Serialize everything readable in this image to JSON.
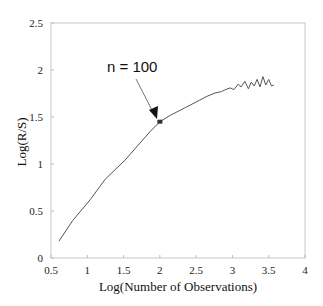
{
  "chart_data": {
    "type": "line",
    "title": "",
    "xlabel": "Log(Number of Observations)",
    "ylabel": "Log(R/S)",
    "xlim": [
      0.5,
      4
    ],
    "ylim": [
      0,
      2.5
    ],
    "xticks": [
      0.5,
      1,
      1.5,
      2,
      2.5,
      3,
      3.5,
      4
    ],
    "xtick_labels": [
      "0.5",
      "1",
      "1.5",
      "2",
      "2.5",
      "3",
      "3.5",
      "4"
    ],
    "yticks": [
      0,
      0.5,
      1,
      1.5,
      2,
      2.5
    ],
    "ytick_labels": [
      "0",
      "0.5",
      "1",
      "1.5",
      "2",
      "2.5"
    ],
    "grid": false,
    "legend": null,
    "series": [
      {
        "name": "R/S",
        "color": "#555555",
        "x": [
          0.61,
          0.8,
          1.04,
          1.25,
          1.52,
          1.7,
          1.86,
          2.0,
          2.15,
          2.35,
          2.55,
          2.65,
          2.76,
          2.85,
          2.9,
          2.97,
          3.02,
          3.08,
          3.12,
          3.17,
          3.22,
          3.26,
          3.3,
          3.34,
          3.38,
          3.42,
          3.46,
          3.5,
          3.54,
          3.57
        ],
        "y": [
          0.18,
          0.4,
          0.62,
          0.84,
          1.04,
          1.2,
          1.34,
          1.45,
          1.52,
          1.6,
          1.68,
          1.72,
          1.755,
          1.77,
          1.79,
          1.81,
          1.79,
          1.85,
          1.82,
          1.88,
          1.8,
          1.87,
          1.83,
          1.9,
          1.82,
          1.93,
          1.84,
          1.9,
          1.83,
          1.84
        ]
      }
    ],
    "annotations": [
      {
        "text": "n = 100",
        "point": {
          "x": 2.0,
          "y": 1.45
        },
        "arrow": true,
        "marker": true
      }
    ]
  }
}
